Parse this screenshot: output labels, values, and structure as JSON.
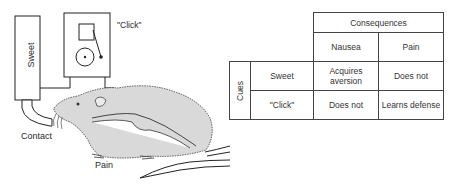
{
  "apparatus": {
    "labels": {
      "sweet": "Sweet",
      "click": "\"Click\"",
      "contact": "Contact",
      "pain": "Pain"
    }
  },
  "table": {
    "header": "Consequences",
    "columns": [
      "Nausea",
      "Pain"
    ],
    "row_group_label": "Cues",
    "rows": [
      {
        "cue": "Sweet",
        "cells": [
          "Acquires aversion",
          "Does not"
        ]
      },
      {
        "cue": "\"Click\"",
        "cells": [
          "Does not",
          "Learns defense"
        ]
      }
    ]
  }
}
